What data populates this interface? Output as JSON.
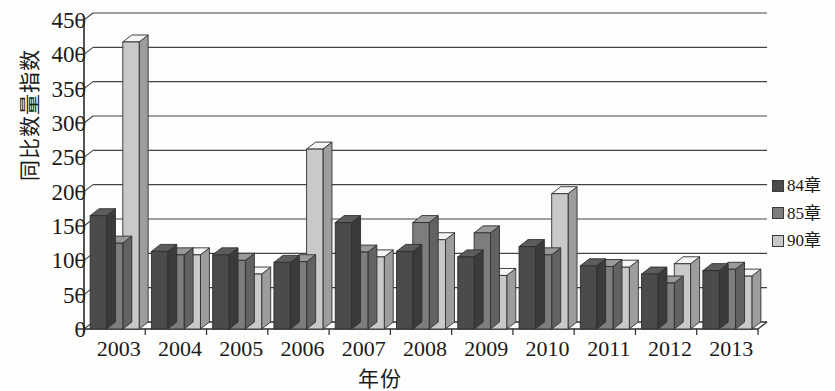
{
  "chart_data": {
    "type": "bar",
    "title": "",
    "xlabel": "年份",
    "ylabel": "同比数量指数",
    "categories": [
      "2003",
      "2004",
      "2005",
      "2006",
      "2007",
      "2008",
      "2009",
      "2010",
      "2011",
      "2012",
      "2013"
    ],
    "series": [
      {
        "name": "84章",
        "color": "#4b4b4b",
        "values": [
          165,
          113,
          108,
          97,
          155,
          113,
          105,
          120,
          92,
          80,
          85
        ]
      },
      {
        "name": "85章",
        "color": "#7d7d7d",
        "values": [
          125,
          108,
          100,
          98,
          112,
          155,
          140,
          108,
          91,
          67,
          87
        ]
      },
      {
        "name": "90章",
        "color": "#c9c9c9",
        "values": [
          418,
          108,
          80,
          262,
          105,
          130,
          78,
          197,
          90,
          95,
          77
        ]
      }
    ],
    "ylim": [
      0,
      450
    ],
    "ytick_step": 50,
    "yticks": [
      "0",
      "50",
      "100",
      "150",
      "200",
      "250",
      "300",
      "350",
      "400",
      "450"
    ],
    "grid": true,
    "legend_position": "right",
    "style": "3d-column"
  },
  "axis": {
    "y_label": "同比数量指数",
    "x_label": "年份"
  },
  "legend": {
    "entries": [
      {
        "label": "84章",
        "color": "#4b4b4b"
      },
      {
        "label": "85章",
        "color": "#7d7d7d"
      },
      {
        "label": "90章",
        "color": "#c9c9c9"
      }
    ]
  },
  "colors": {
    "series_84": "#4b4b4b",
    "series_85": "#7d7d7d",
    "series_90": "#c9c9c9",
    "axis": "#2a2a2a",
    "grid": "#444444",
    "background": "#fdfdfb"
  }
}
